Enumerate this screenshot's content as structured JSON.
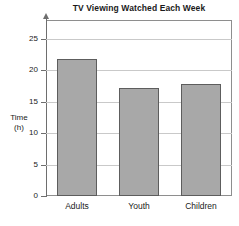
{
  "chart_data": {
    "type": "bar",
    "title": "TV Viewing Watched Each Week",
    "xlabel": "",
    "ylabel": "Time (h)",
    "ylabel_lines": [
      "Time",
      "(h)"
    ],
    "categories": [
      "Adults",
      "Youth",
      "Children"
    ],
    "values": [
      21.8,
      17.2,
      17.8
    ],
    "series": [
      {
        "name": "Hours watched",
        "values": [
          21.8,
          17.2,
          17.8
        ]
      }
    ],
    "ylim": [
      0,
      28
    ],
    "yticks": [
      0,
      5,
      10,
      15,
      20,
      25
    ],
    "ytick_labels": [
      "0",
      "5",
      "10",
      "15",
      "20",
      "25"
    ],
    "gridlines": true,
    "grid_axis": "y",
    "legend": false,
    "legend_position": "none",
    "bar_color": "#a8a8a8",
    "bar_border_color": "#5d5d5d",
    "grid_color": "#c9c9c9",
    "axis_color": "#6e6e6e",
    "frame_color": "#8e8e8e",
    "background_color": "#ffffff",
    "y_axis_arrow": true
  }
}
